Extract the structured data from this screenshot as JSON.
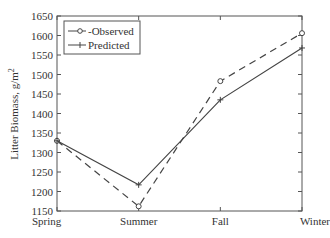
{
  "chart_data": {
    "type": "line",
    "title": "",
    "xlabel": "",
    "ylabel": "Litter Biomass, g/m",
    "ylabel_superscript": "2",
    "categories": [
      "Spring",
      "Summer",
      "Fall",
      "Winter"
    ],
    "ylim": [
      1150,
      1650
    ],
    "yticks": [
      1150,
      1200,
      1250,
      1300,
      1350,
      1400,
      1450,
      1500,
      1550,
      1600,
      1650
    ],
    "grid": false,
    "legend_position": "upper left",
    "series": [
      {
        "name": "Observed",
        "legend_label": "-Observed",
        "style": "dashed",
        "marker": "circle",
        "color": "#444444",
        "values": [
          1330,
          1162,
          1483,
          1606
        ]
      },
      {
        "name": "Predicted",
        "legend_label": "Predicted",
        "style": "solid",
        "marker": "plus",
        "color": "#444444",
        "values": [
          1330,
          1217,
          1435,
          1568
        ]
      }
    ]
  }
}
